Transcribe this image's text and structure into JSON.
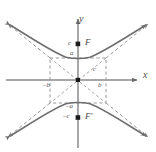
{
  "figure": {
    "colors": {
      "axis": "#7a7a7c",
      "curve": "#6e6e70",
      "dashed": "#8d8d8f",
      "marker": "#1a1a1a",
      "label": "#59595b",
      "background": "#ffffff"
    },
    "axes": {
      "x_label": "x",
      "y_label": "y",
      "origin_marker": "square-point"
    },
    "labels": {
      "vertex_positive": "a",
      "vertex_negative": "–a",
      "conjugate_positive": "b",
      "conjugate_negative": "–b",
      "focal_positive": "c",
      "focal_negative": "–c",
      "diagonal": "c",
      "focus_upper": "F",
      "focus_lower": "F′"
    },
    "points": [
      {
        "name": "focus-upper",
        "label": "F",
        "value_label": "c"
      },
      {
        "name": "focus-lower",
        "label": "F′",
        "value_label": "–c"
      },
      {
        "name": "vertex-upper",
        "label": "a"
      },
      {
        "name": "vertex-lower",
        "label": "–a"
      },
      {
        "name": "center",
        "label": ""
      }
    ],
    "elements": {
      "branches": 2,
      "asymptotes": 2,
      "guide_rectangle": true,
      "guide_diagonals": true
    }
  }
}
